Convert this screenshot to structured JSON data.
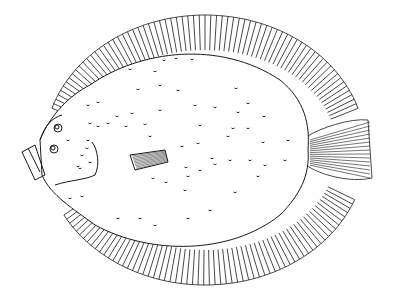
{
  "image": {
    "subject": "flatfish (flounder) line illustration",
    "background": "#ffffff",
    "stroke": "#1a1a1a",
    "width": 398,
    "height": 304
  },
  "fish": {
    "eyes": [
      {
        "cx": 58,
        "cy": 128,
        "r": 4
      },
      {
        "cx": 54,
        "cy": 149,
        "r": 4
      }
    ],
    "spots": [
      [
        164,
        60
      ],
      [
        176,
        58
      ],
      [
        192,
        59
      ],
      [
        130,
        69
      ],
      [
        155,
        71
      ],
      [
        138,
        89
      ],
      [
        160,
        85
      ],
      [
        178,
        90
      ],
      [
        236,
        88
      ],
      [
        88,
        105
      ],
      [
        98,
        102
      ],
      [
        195,
        105
      ],
      [
        215,
        107
      ],
      [
        248,
        103
      ],
      [
        117,
        116
      ],
      [
        132,
        113
      ],
      [
        160,
        110
      ],
      [
        238,
        112
      ],
      [
        264,
        116
      ],
      [
        200,
        125
      ],
      [
        145,
        124
      ],
      [
        126,
        126
      ],
      [
        90,
        123
      ],
      [
        98,
        126
      ],
      [
        108,
        123
      ],
      [
        233,
        128
      ],
      [
        248,
        128
      ],
      [
        150,
        136
      ],
      [
        198,
        143
      ],
      [
        228,
        136
      ],
      [
        182,
        146
      ],
      [
        263,
        142
      ],
      [
        288,
        140
      ],
      [
        68,
        140
      ],
      [
        88,
        140
      ],
      [
        87,
        148
      ],
      [
        212,
        158
      ],
      [
        230,
        160
      ],
      [
        250,
        160
      ],
      [
        285,
        160
      ],
      [
        82,
        155
      ],
      [
        90,
        162
      ],
      [
        80,
        168
      ],
      [
        215,
        164
      ],
      [
        186,
        167
      ],
      [
        200,
        170
      ],
      [
        78,
        166
      ],
      [
        265,
        165
      ],
      [
        188,
        176
      ],
      [
        258,
        176
      ],
      [
        153,
        178
      ],
      [
        166,
        182
      ],
      [
        185,
        190
      ],
      [
        235,
        192
      ],
      [
        70,
        198
      ],
      [
        82,
        196
      ],
      [
        118,
        218
      ],
      [
        140,
        218
      ],
      [
        188,
        218
      ],
      [
        210,
        210
      ],
      [
        155,
        225
      ]
    ]
  }
}
